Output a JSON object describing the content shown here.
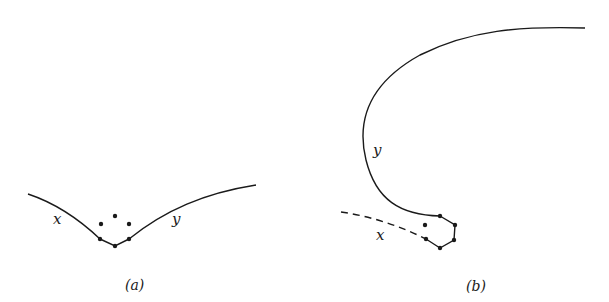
{
  "panels": [
    {
      "id": "a",
      "caption": "(a)",
      "labels": {
        "left_curve": "x",
        "right_curve": "y"
      }
    },
    {
      "id": "b",
      "caption": "(b)",
      "labels": {
        "solid_curve": "y",
        "dashed_curve": "x"
      }
    }
  ],
  "colors": {
    "stroke": "#1a1a1a",
    "background": "#ffffff"
  }
}
